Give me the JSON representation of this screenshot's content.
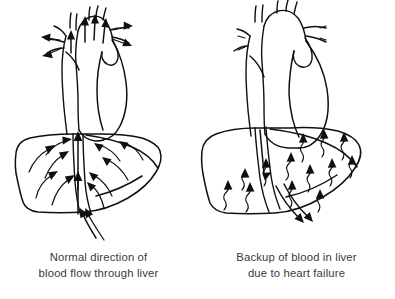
{
  "figure": {
    "style": "black-and-white line drawing",
    "background_color": "#ffffff",
    "ink_color": "#101010",
    "caption_color": "#3a3a3a"
  },
  "panels": [
    {
      "id": "normal",
      "caption_line1": "Normal direction of",
      "caption_line2": "blood flow through liver",
      "heart": {
        "label": "heart",
        "state": "normal size",
        "great_vessels": [
          "superior vena cava",
          "aortic arch",
          "pulmonary artery",
          "inferior vena cava"
        ]
      },
      "liver": {
        "label": "liver",
        "state": "normal"
      },
      "flow": {
        "direction": "upward, toward the heart",
        "arrow_style": "smooth curved and straight arrows",
        "description": "blood converges through the liver and ascends the inferior vena cava into the heart"
      }
    },
    {
      "id": "failure",
      "caption_line1": "Backup of blood in liver",
      "caption_line2": "due to heart failure",
      "heart": {
        "label": "heart",
        "state": "enlarged and dilated",
        "great_vessels": [
          "superior vena cava",
          "aortic arch",
          "pulmonary artery",
          "inferior vena cava"
        ]
      },
      "liver": {
        "label": "liver",
        "state": "congested"
      },
      "flow": {
        "direction": "downward, backing into the liver",
        "arrow_style": "wavy turbulent arrows",
        "description": "blood backs up out of the failing heart down the inferior vena cava and pools in the liver"
      }
    }
  ]
}
